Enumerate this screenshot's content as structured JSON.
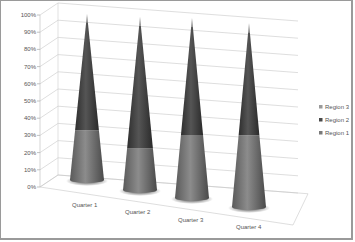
{
  "chart_data": {
    "type": "bar",
    "subtype": "3d-cone-100-percent-stacked",
    "title": "",
    "xlabel": "",
    "ylabel": "",
    "categories": [
      "Quarter 1",
      "Quarter 2",
      "Quarter 3",
      "Quarter 4"
    ],
    "series": [
      {
        "name": "Region 1",
        "values": [
          30,
          24,
          35,
          39
        ],
        "color": "#7a7a7a"
      },
      {
        "name": "Region 2",
        "values": [
          65,
          71,
          60,
          56
        ],
        "color": "#4a4a4a"
      },
      {
        "name": "Region 3",
        "values": [
          5,
          5,
          5,
          5
        ],
        "color": "#9a9a9a"
      }
    ],
    "y_ticks": [
      "0%",
      "10%",
      "20%",
      "30%",
      "40%",
      "50%",
      "60%",
      "70%",
      "80%",
      "90%",
      "100%"
    ],
    "ylim": [
      0,
      100
    ],
    "grid": true,
    "legend": {
      "position": "right",
      "entries": [
        "Region 3",
        "Region 2",
        "Region 1"
      ]
    }
  }
}
